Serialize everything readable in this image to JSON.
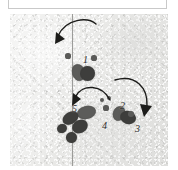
{
  "caption_box": {
    "text": ""
  },
  "figure": {
    "title": "",
    "surface": "textured sediment / plaster cast plate",
    "midline": {
      "name": "vertical reference line",
      "color": "#8e8e8c",
      "orientation": "vertical"
    },
    "colors": {
      "background": "#eaeae8",
      "impression": "#4c4c4a",
      "impression_dark": "#3e3e3c",
      "impression_mid": "#5c5c5a",
      "arrow": "#1c1c1a",
      "label": "#2b2b29",
      "midline": "#8e8e8c",
      "note": "#8c8c8a"
    },
    "side_notes": [
      {
        "id": "note-upper",
        "text": "·····",
        "x": 9,
        "y": 46
      },
      {
        "id": "note-lower",
        "text": "····",
        "x": 9,
        "y": 106
      }
    ],
    "callouts": [
      {
        "id": "callout-1",
        "label": "1",
        "x": 73,
        "y": 41
      },
      {
        "id": "callout-2",
        "label": "2",
        "x": 110,
        "y": 87
      },
      {
        "id": "callout-3",
        "label": "3",
        "x": 125,
        "y": 110
      },
      {
        "id": "callout-4",
        "label": "4",
        "x": 92,
        "y": 107
      },
      {
        "id": "callout-5",
        "label": "5",
        "x": 62,
        "y": 90
      }
    ],
    "impressions": [
      {
        "id": "imp-1a",
        "x": 62,
        "y": 50,
        "w": 13,
        "h": 17,
        "rot": -18,
        "tone": "mid"
      },
      {
        "id": "imp-1b",
        "x": 70,
        "y": 52,
        "w": 15,
        "h": 15,
        "rot": 20,
        "tone": "dark"
      },
      {
        "id": "imp-5a",
        "x": 67,
        "y": 92,
        "w": 19,
        "h": 13,
        "rot": -12,
        "tone": "mid"
      },
      {
        "id": "imp-5b",
        "x": 52,
        "y": 98,
        "w": 17,
        "h": 12,
        "rot": -32,
        "tone": "dark"
      },
      {
        "id": "imp-5c",
        "x": 62,
        "y": 106,
        "w": 16,
        "h": 13,
        "rot": -28,
        "tone": "dark"
      },
      {
        "id": "imp-5d",
        "x": 47,
        "y": 110,
        "w": 10,
        "h": 9,
        "rot": -20,
        "tone": "dark"
      },
      {
        "id": "imp-5e",
        "x": 56,
        "y": 118,
        "w": 11,
        "h": 11,
        "rot": -15,
        "tone": "dark"
      },
      {
        "id": "imp-2a",
        "x": 103,
        "y": 92,
        "w": 12,
        "h": 15,
        "rot": 22,
        "tone": "mid"
      },
      {
        "id": "imp-2b",
        "x": 110,
        "y": 97,
        "w": 16,
        "h": 13,
        "rot": 18,
        "tone": "dark"
      }
    ],
    "small_dots": [
      {
        "id": "dot-1l",
        "x": 58,
        "y": 42,
        "r": 2.6
      },
      {
        "id": "dot-1r",
        "x": 84,
        "y": 44,
        "r": 2.6
      },
      {
        "id": "dot-4a",
        "x": 92,
        "y": 86,
        "r": 2.4
      },
      {
        "id": "dot-4b",
        "x": 99,
        "y": 84,
        "r": 2.4
      },
      {
        "id": "dot-4c",
        "x": 96,
        "y": 94,
        "r": 2.6
      },
      {
        "id": "dot-3a",
        "x": 121,
        "y": 100,
        "r": 2.8
      }
    ],
    "arrows": [
      {
        "id": "arrow-top",
        "description": "curved arrow sweeping from upper right to lower left, toward impression 1",
        "path": "M 86 10 C 78 3 56 4 48 22",
        "head": "45,30 46,18 55,25",
        "direction": "down-left"
      },
      {
        "id": "arrow-middle",
        "description": "curved arrow arcing from right to left, toward impression 5",
        "path": "M 100 86 C 92 70 72 70 66 82",
        "head": "62,92 63,79 71,85",
        "direction": "down-left"
      },
      {
        "id": "arrow-right",
        "description": "curved arrow sweeping from upper left to lower right, toward impression 3",
        "path": "M 105 66 C 126 60 138 74 137 92",
        "head": "134,103 130,90 142,92",
        "direction": "down-right"
      }
    ]
  }
}
